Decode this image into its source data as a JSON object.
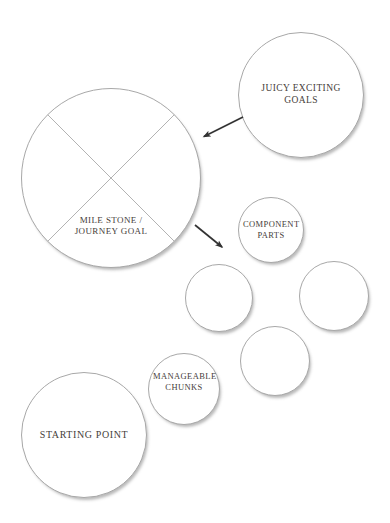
{
  "diagram": {
    "nodes": {
      "juicy_goals": {
        "label": "JUICY EXCITING GOALS"
      },
      "milestone": {
        "label": "MILE STONE / JOURNEY GOAL"
      },
      "component_parts": {
        "label": "COMPONENT PARTS"
      },
      "manageable_chunks": {
        "label": "MANAGEABLE CHUNKS"
      },
      "starting_point": {
        "label": "STARTING POINT"
      }
    },
    "colors": {
      "background": "#ffffff",
      "circle_border": "#a8a8a8",
      "cross_lines": "#b3b3b3",
      "label_text": "#46403a",
      "arrow": "#333333"
    }
  }
}
